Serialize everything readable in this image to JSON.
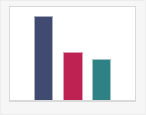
{
  "figure": {
    "width": 146,
    "height": 115,
    "background_color": "#f6f6f6",
    "plot_background_color": "#ffffff",
    "frame_color": "#d9d9d9"
  },
  "chart_data": {
    "type": "bar",
    "title": "",
    "subtitle": "",
    "xlabel": "",
    "ylabel": "",
    "categories": [
      "1",
      "2",
      "3"
    ],
    "values": [
      100,
      58,
      50
    ],
    "ylim": [
      0,
      100
    ],
    "xlim": [
      0,
      3
    ],
    "grid": false,
    "legend": false,
    "legend_position": "none",
    "xtick_labels": [],
    "ytick_labels": [],
    "annotations": [],
    "bars": [
      {
        "category": "1",
        "value": 100,
        "color": "#414b72",
        "color_name": "navy",
        "left_pct": 19.0,
        "width_pct": 15.5,
        "height_pct": 90.0
      },
      {
        "category": "2",
        "value": 58,
        "color": "#be2253",
        "color_name": "crimson",
        "left_pct": 42.6,
        "width_pct": 15.5,
        "height_pct": 52.0
      },
      {
        "category": "3",
        "value": 50,
        "color": "#2e8285",
        "color_name": "teal",
        "left_pct": 65.4,
        "width_pct": 15.5,
        "height_pct": 45.0
      }
    ]
  }
}
